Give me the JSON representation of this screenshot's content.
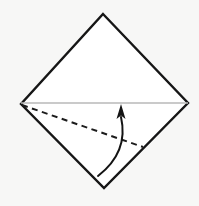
{
  "canvas": {
    "width": 199,
    "height": 206,
    "background_color": "#f7f7f6",
    "title": "origami-fold-diagram"
  },
  "figure": {
    "name": "origami folding step diagram",
    "shape": {
      "name": "diamond-square",
      "stroke_color": "#161616",
      "fill_color": "#ffffff",
      "stroke_width": 2.4,
      "vertices": [
        {
          "label": "top",
          "x": 103,
          "y": 14
        },
        {
          "label": "right",
          "x": 188,
          "y": 103
        },
        {
          "label": "bottom",
          "x": 104,
          "y": 188
        },
        {
          "label": "left",
          "x": 21,
          "y": 104
        }
      ]
    },
    "horizontal_line": {
      "name": "mid-diagonal-line",
      "stroke_color": "#b9b9b9",
      "stroke_width": 1.6,
      "from": {
        "x": 21,
        "y": 103
      },
      "to": {
        "x": 188,
        "y": 103
      }
    },
    "fold_line": {
      "name": "dashed-fold-line",
      "style": "dashed",
      "stroke_color": "#1c1c1c",
      "stroke_width": 2,
      "dash_length": 6,
      "gap_length": 4.5,
      "from": {
        "x": 22,
        "y": 105
      },
      "to": {
        "x": 143,
        "y": 147
      }
    },
    "arrow": {
      "name": "fold-direction-arrow",
      "stroke_color": "#141414",
      "stroke_width": 2,
      "direction": "upward",
      "tail": {
        "x": 98,
        "y": 176
      },
      "control": {
        "x": 129,
        "y": 152
      },
      "tip": {
        "x": 121,
        "y": 104
      },
      "head": {
        "width": 9,
        "height": 13,
        "fill_color": "#141414"
      }
    }
  }
}
